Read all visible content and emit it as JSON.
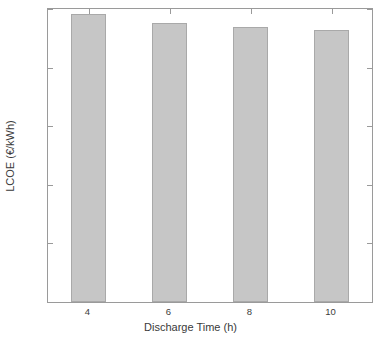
{
  "chart_data": {
    "type": "bar",
    "title": "",
    "xlabel": "Discharge Time (h)",
    "ylabel": "LCOE (€/kWh)",
    "categories": [
      "4",
      "6",
      "8",
      "10"
    ],
    "values": [
      0.2455,
      0.238,
      0.2345,
      0.2325
    ],
    "ylim": [
      0,
      0.25
    ],
    "ytick_labels": [
      "0",
      "0.05",
      "0.1",
      "0.15",
      "0.2",
      "0.25"
    ],
    "ytick_values": [
      0,
      0.05,
      0.1,
      0.15,
      0.2,
      0.25
    ],
    "xtick_labels": [
      "4",
      "6",
      "8",
      "10"
    ],
    "grid": false,
    "legend": null,
    "bar_color": "#c6c6c6",
    "bar_edge_color": "#a9a9a9",
    "axis_color": "#9a9a9a",
    "background_color": "#ffffff"
  }
}
